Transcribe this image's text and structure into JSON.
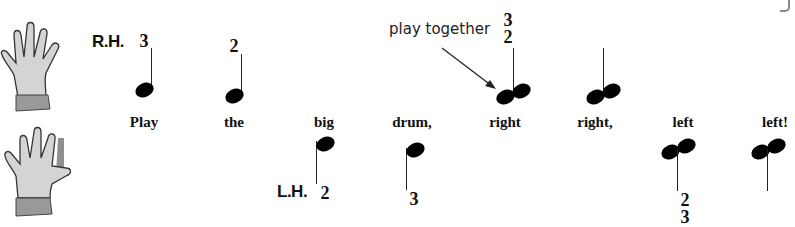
{
  "right_hand": {
    "label": "R.H.",
    "icon": "right-hand-icon"
  },
  "left_hand": {
    "label": "L.H.",
    "icon": "left-hand-icon"
  },
  "annotation": {
    "text": "play together",
    "arrow": "arrow-icon"
  },
  "lyrics": [
    "Play",
    "the",
    "big",
    "drum,",
    "right",
    "right,",
    "left",
    "left!"
  ],
  "notes": [
    {
      "hand": "R.H.",
      "fingering": "3",
      "type": "quarter",
      "stem": "up"
    },
    {
      "hand": "R.H.",
      "fingering": "2",
      "type": "quarter",
      "stem": "up"
    },
    {
      "hand": "L.H.",
      "fingering": "2",
      "type": "quarter",
      "stem": "down"
    },
    {
      "hand": "L.H.",
      "fingering": "3",
      "type": "quarter",
      "stem": "down"
    },
    {
      "hand": "R.H.",
      "fingering": [
        "3",
        "2"
      ],
      "type": "quarter-chord",
      "stem": "up"
    },
    {
      "hand": "R.H.",
      "fingering": "",
      "type": "quarter-chord",
      "stem": "up"
    },
    {
      "hand": "L.H.",
      "fingering": [
        "2",
        "3"
      ],
      "type": "quarter-chord",
      "stem": "down"
    },
    {
      "hand": "L.H.",
      "fingering": "",
      "type": "quarter-chord",
      "stem": "down"
    }
  ],
  "fingering_labels": {
    "n1": "3",
    "n2": "2",
    "n3": "2",
    "n4": "3",
    "n5_top": "3",
    "n5_bottom": "2",
    "n7_top": "2",
    "n7_bottom": "3"
  }
}
